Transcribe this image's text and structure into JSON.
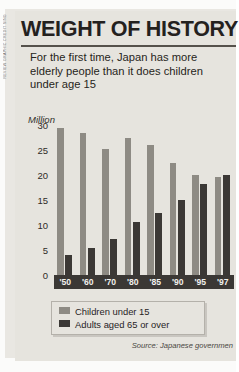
{
  "credit": "REVIEW GRAPHIC CREDIT SING",
  "header": {
    "title": "WEIGHT OF HISTORY",
    "subtitle": "For the first time, Japan has more elderly people than it does children under age 15"
  },
  "source": "Source: Japanese governmen",
  "chart_data": {
    "type": "bar",
    "title": "WEIGHT OF HISTORY",
    "subtitle": "For the first time, Japan has more elderly people than it does children under age 15",
    "xlabel": "",
    "ylabel": "Million",
    "ylim": [
      0,
      30
    ],
    "yticks": [
      0,
      5,
      10,
      15,
      20,
      25,
      30
    ],
    "grid": false,
    "legend_position": "bottom",
    "categories": [
      "'50",
      "'60",
      "'70",
      "'80",
      "'85",
      "'90",
      "'95",
      "'97"
    ],
    "series": [
      {
        "name": "Children under 15",
        "color": "#8e8b84",
        "values": [
          29.4,
          28.4,
          25.2,
          27.5,
          26.0,
          22.5,
          20.0,
          19.7
        ]
      },
      {
        "name": "Adults aged  65 or over",
        "color": "#3b3835",
        "values": [
          4.1,
          5.4,
          7.3,
          10.6,
          12.5,
          15.0,
          18.3,
          20.0
        ]
      }
    ]
  }
}
